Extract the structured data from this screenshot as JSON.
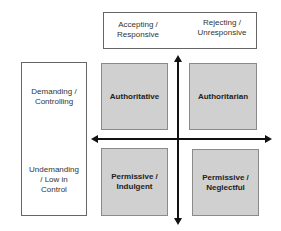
{
  "diagram": {
    "top_header": {
      "left_label": "Accepting / Responsive",
      "left_lines": [
        "Accepting /",
        "Responsive"
      ],
      "right_label": "Rejecting / Unresponsive",
      "right_lines": [
        "Rejecting /",
        "Unresponsive"
      ]
    },
    "side_header": {
      "top_label": "Demanding / Controlling",
      "top_lines": [
        "Demanding /",
        "Controlling"
      ],
      "bottom_label": "Undemanding / Low in Control",
      "bottom_lines": [
        "Undemanding",
        "/ Low in",
        "Control"
      ]
    },
    "quadrants": [
      {
        "position": "top-left",
        "lines": [
          "Authoritative"
        ]
      },
      {
        "position": "top-right",
        "lines": [
          "Authoritarian"
        ]
      },
      {
        "position": "bottom-left",
        "lines": [
          "Permissive /",
          "Indulgent"
        ]
      },
      {
        "position": "bottom-right",
        "lines": [
          "Permissive /",
          "Neglectful"
        ]
      }
    ],
    "colors": {
      "quadrant_fill": "#d0d0d0",
      "quadrant_border": "#8a8a8a",
      "axis": "#111111",
      "frame_border": "#666666"
    }
  }
}
